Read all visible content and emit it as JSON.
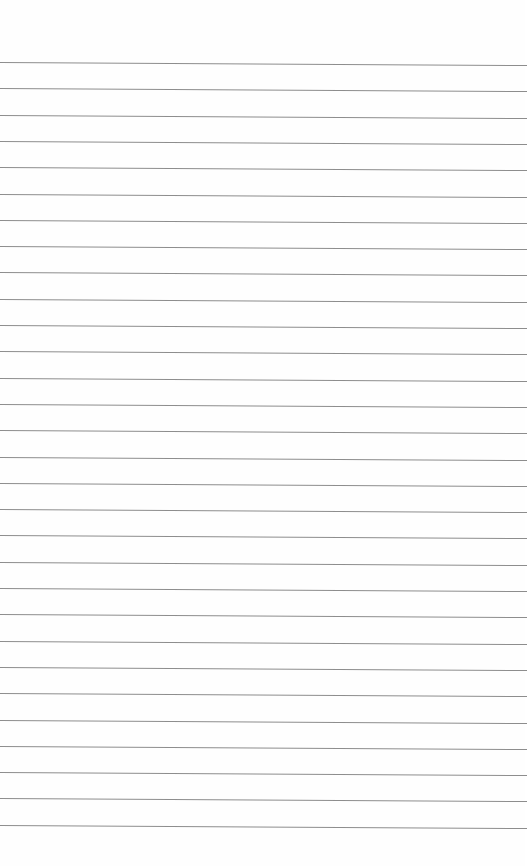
{
  "page": {
    "type": "blank ruled paper",
    "line_count": 30,
    "first_line_y": 62,
    "line_spacing": 26.3,
    "line_color": "#8d8d8d",
    "background": "#fefefe"
  }
}
